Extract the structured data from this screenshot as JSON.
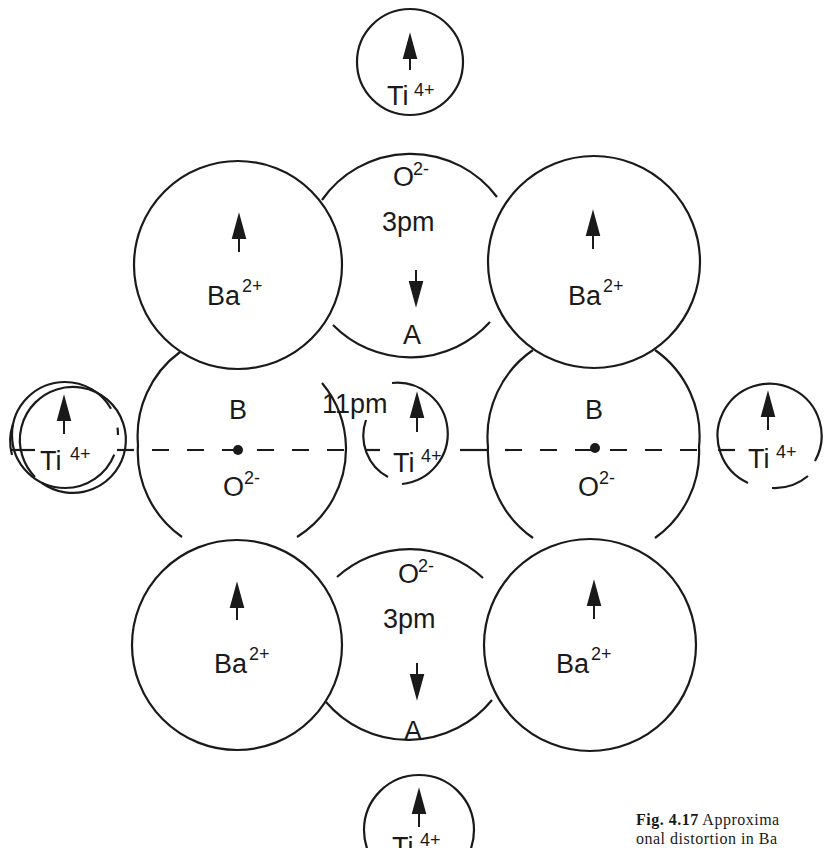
{
  "diagram": {
    "ions": {
      "ti_top": {
        "symbol": "Ti",
        "charge": "4+",
        "arrow": "up"
      },
      "o_top": {
        "symbol": "O",
        "charge": "2-",
        "displacement": "3pm",
        "site": "A",
        "arrow": "down"
      },
      "ba_top_left": {
        "symbol": "Ba",
        "charge": "2+",
        "arrow": "up"
      },
      "ba_top_right": {
        "symbol": "Ba",
        "charge": "2+",
        "arrow": "up"
      },
      "ti_left": {
        "symbol": "Ti",
        "charge": "4+",
        "arrow": "up"
      },
      "o_left": {
        "symbol": "O",
        "charge": "2-",
        "site": "B"
      },
      "ti_center": {
        "symbol": "Ti",
        "charge": "4+",
        "displacement": "11pm",
        "arrow": "up"
      },
      "o_right": {
        "symbol": "O",
        "charge": "2-",
        "site": "B"
      },
      "ti_right": {
        "symbol": "Ti",
        "charge": "4+",
        "arrow": "up"
      },
      "ba_bottom_left": {
        "symbol": "Ba",
        "charge": "2+",
        "arrow": "up"
      },
      "ba_bottom_right": {
        "symbol": "Ba",
        "charge": "2+",
        "arrow": "up"
      },
      "o_bottom": {
        "symbol": "O",
        "charge": "2-",
        "displacement": "3pm",
        "site": "A",
        "arrow": "down"
      },
      "ti_bottom": {
        "symbol": "Ti",
        "charge": "4+",
        "arrow": "up"
      }
    },
    "colors": {
      "stroke": "#1a1a1a",
      "background": "#ffffff"
    }
  },
  "caption": {
    "fig_label": "Fig. 4.17",
    "line1": "Approxima",
    "line2": "onal distortion in Ba"
  }
}
